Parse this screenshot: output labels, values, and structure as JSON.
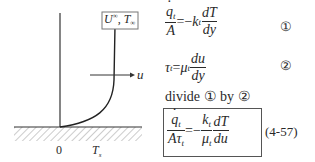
{
  "diagram": {
    "freestream_label": {
      "U": "U",
      "U_sup": "∞",
      "sep": ",",
      "T": "T",
      "T_sub": "∞"
    },
    "velocity_label": "u",
    "origin_label": "0",
    "wall_temp_label": {
      "T": "T",
      "sub": "s"
    }
  },
  "equations": [
    {
      "id": "1",
      "marker": "①",
      "lhs_num": "q",
      "lhs_num_sub": "t",
      "lhs_den": "A",
      "eq": "=−",
      "coef": "k",
      "coef_sub": "t",
      "d_num": "dT",
      "d_den": "dy"
    },
    {
      "id": "2",
      "marker": "②",
      "lhs": "τ",
      "lhs_sub": "t",
      "eq": "=",
      "coef": "μ",
      "coef_sub": "t",
      "d_num": "du",
      "d_den": "dy"
    }
  ],
  "instruction": {
    "text": "divide",
    "a": "①",
    "by": "by",
    "b": "②"
  },
  "result": {
    "lhs_num": "q",
    "lhs_num_sub": "t",
    "lhs_den": "Aτ",
    "lhs_den_sub": "t",
    "eq": "=−",
    "c_num": "k",
    "c_num_sub": "t",
    "c_den": "μ",
    "c_den_sub": "t",
    "d_num": "dT",
    "d_den": "du",
    "number": "(4-57)"
  }
}
